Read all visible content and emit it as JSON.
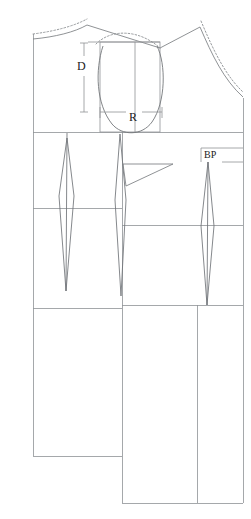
{
  "document": {
    "type": "sewing-pattern-draft",
    "title": "Bodice block pattern draft with sleeve cap",
    "caption": ""
  },
  "labels": {
    "sleeve_depth": "D",
    "sleeve_radius": "R",
    "bust_point": "BP"
  },
  "colors": {
    "background": "#ffffff",
    "construction_line": "#8f9296",
    "outline": "#6f7377",
    "dotted_line": "#8b8e92",
    "text": "#1a1a1a"
  },
  "geometry": {
    "canvas": {
      "width": 251,
      "height": 519
    },
    "horizontal_rules": [
      {
        "name": "chest-line",
        "y": 132,
        "x1": 33,
        "x2": 243
      },
      {
        "name": "waist-line",
        "y": 208,
        "x1": 33,
        "x2": 122
      },
      {
        "name": "waist-line-right",
        "y": 225,
        "x1": 122,
        "x2": 243
      },
      {
        "name": "hip-line-left",
        "y": 308,
        "x1": 33,
        "x2": 122
      },
      {
        "name": "hip-line-right",
        "y": 305,
        "x1": 122,
        "x2": 243
      },
      {
        "name": "hem-left",
        "y": 456,
        "x1": 33,
        "x2": 122
      },
      {
        "name": "hem-right",
        "y": 503,
        "x1": 122,
        "x2": 243
      }
    ],
    "vertical_rules": [
      {
        "name": "left-edge",
        "x": 33,
        "y1": 34,
        "y2": 456
      },
      {
        "name": "center-front",
        "x": 122,
        "y1": 132,
        "y2": 503
      },
      {
        "name": "side-seam",
        "x": 197,
        "y1": 305,
        "y2": 503
      },
      {
        "name": "right-edge",
        "x": 243,
        "y1": 98,
        "y2": 503
      }
    ],
    "darts": [
      {
        "name": "back-shoulder-dart",
        "apex_x": 67,
        "top_y": 138,
        "mid_y": 196,
        "bottom_y": 291,
        "half_width": 8
      },
      {
        "name": "front-side-dart",
        "apex_x": 120,
        "top_y": 134,
        "mid_y": 200,
        "bottom_y": 296,
        "half_width": 4
      },
      {
        "name": "bust-dart",
        "apex_x": 208,
        "top_y": 162,
        "mid_y": 226,
        "bottom_y": 305,
        "half_width": 7
      }
    ],
    "sleeve_cap": {
      "left_x": 100,
      "right_x": 160,
      "top_y": 40,
      "bottom_y": 133,
      "box": {
        "x": 88,
        "y": 42,
        "w": 72,
        "h": 70
      }
    },
    "dimension_lines": {
      "D": {
        "x": 84,
        "y1": 43,
        "y2": 112,
        "label_y": 66
      },
      "R": {
        "y": 112,
        "x1": 100,
        "x2": 160,
        "label_x": 129
      }
    }
  },
  "elements": [
    {
      "name": "left-shoulder-slope",
      "type": "line"
    },
    {
      "name": "left-neckline-dotted",
      "type": "dotted-curve"
    },
    {
      "name": "right-shoulder-slope",
      "type": "line"
    },
    {
      "name": "right-armhole-curve",
      "type": "curve"
    },
    {
      "name": "right-armhole-dotted",
      "type": "dotted-curve"
    },
    {
      "name": "sleeve-cap-curve",
      "type": "curve"
    },
    {
      "name": "sleeve-cap-dotted",
      "type": "dotted-curve"
    },
    {
      "name": "side-bust-wedge",
      "type": "wedge"
    }
  ]
}
